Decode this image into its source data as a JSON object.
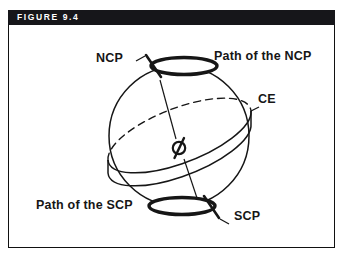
{
  "figure": {
    "header_label": "FIGURE 9.4",
    "colors": {
      "header_background": "#16161a",
      "header_text": "#ffffff",
      "frame_border": "#111111",
      "page_background": "#ffffff",
      "ink": "#161616"
    }
  },
  "diagram": {
    "type": "celestial-sphere-precession",
    "labels": {
      "ncp": "NCP",
      "path_of_the_ncp": "Path of the NCP",
      "ce": "CE",
      "path_of_the_scp": "Path of the SCP",
      "scp": "SCP"
    },
    "elements": {
      "sphere": "celestial-sphere-outline",
      "ncp_path_ellipse": "precession-circle-north",
      "scp_path_ellipse": "precession-circle-south",
      "ecliptic_band": "tilted-ecliptic-disk",
      "ecliptic_hidden_arc": "dashed-rear-arc",
      "earth_symbol": "earth-at-center",
      "axis_north": "axis-line-to-ncp",
      "axis_south": "axis-line-to-scp",
      "ncp_tick": "north-pole-tick-mark",
      "scp_tick": "south-pole-tick-mark"
    }
  }
}
